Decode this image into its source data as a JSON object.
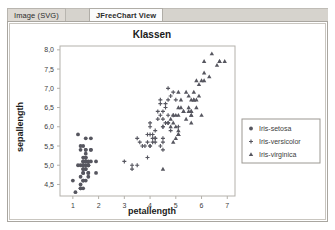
{
  "window": {
    "tabs": [
      {
        "label": "Image (SVG)",
        "active": false
      },
      {
        "label": "JFreeChart View",
        "active": true
      }
    ]
  },
  "chart_data": {
    "type": "scatter",
    "title": "Klassen",
    "xlabel": "petallength",
    "ylabel": "sepallength",
    "xlim": [
      0.5,
      7.3
    ],
    "ylim": [
      4.2,
      8.1
    ],
    "xticks": [
      "1",
      "2",
      "3",
      "4",
      "5",
      "6",
      "7"
    ],
    "xtick_values": [
      1,
      2,
      3,
      4,
      5,
      6,
      7
    ],
    "yticks": [
      "4,5",
      "5,0",
      "5,5",
      "6,0",
      "6,5",
      "7,0",
      "7,5",
      "8,0"
    ],
    "ytick_values": [
      4.5,
      5.0,
      5.5,
      6.0,
      6.5,
      7.0,
      7.5,
      8.0
    ],
    "grid": false,
    "legend_position": "right",
    "colors": {
      "point": "#5a5a66",
      "frame": "#b4b1ab",
      "text": "#1a1a1a"
    },
    "series": [
      {
        "name": "Iris-setosa",
        "marker": "circle",
        "color": "#56565f",
        "points": [
          [
            1.4,
            5.1
          ],
          [
            1.4,
            4.9
          ],
          [
            1.3,
            4.7
          ],
          [
            1.5,
            4.6
          ],
          [
            1.4,
            5.0
          ],
          [
            1.7,
            5.4
          ],
          [
            1.4,
            4.6
          ],
          [
            1.5,
            5.0
          ],
          [
            1.4,
            4.4
          ],
          [
            1.5,
            4.9
          ],
          [
            1.5,
            5.4
          ],
          [
            1.6,
            4.8
          ],
          [
            1.4,
            4.8
          ],
          [
            1.1,
            4.3
          ],
          [
            1.2,
            5.8
          ],
          [
            1.5,
            5.7
          ],
          [
            1.3,
            5.4
          ],
          [
            1.4,
            5.1
          ],
          [
            1.7,
            5.7
          ],
          [
            1.5,
            5.1
          ],
          [
            1.7,
            5.4
          ],
          [
            1.5,
            5.1
          ],
          [
            1.0,
            4.6
          ],
          [
            1.7,
            5.1
          ],
          [
            1.9,
            4.8
          ],
          [
            1.6,
            5.0
          ],
          [
            1.6,
            5.0
          ],
          [
            1.5,
            5.2
          ],
          [
            1.4,
            5.2
          ],
          [
            1.6,
            4.7
          ],
          [
            1.6,
            4.8
          ],
          [
            1.5,
            5.4
          ],
          [
            1.5,
            5.2
          ],
          [
            1.4,
            5.5
          ],
          [
            1.5,
            4.9
          ],
          [
            1.2,
            5.0
          ],
          [
            1.3,
            5.5
          ],
          [
            1.4,
            4.9
          ],
          [
            1.3,
            4.4
          ],
          [
            1.5,
            5.1
          ],
          [
            1.3,
            5.0
          ],
          [
            1.3,
            4.5
          ],
          [
            1.3,
            4.4
          ],
          [
            1.6,
            5.0
          ],
          [
            1.9,
            5.1
          ],
          [
            1.4,
            4.8
          ],
          [
            1.6,
            5.1
          ],
          [
            1.4,
            4.6
          ],
          [
            1.5,
            5.3
          ],
          [
            1.4,
            5.0
          ]
        ]
      },
      {
        "name": "Iris-versicolor",
        "marker": "plus",
        "color": "#56565f",
        "points": [
          [
            4.7,
            7.0
          ],
          [
            4.5,
            6.4
          ],
          [
            4.9,
            6.9
          ],
          [
            4.0,
            5.5
          ],
          [
            4.6,
            6.5
          ],
          [
            4.5,
            5.7
          ],
          [
            4.7,
            6.3
          ],
          [
            3.3,
            4.9
          ],
          [
            4.6,
            6.6
          ],
          [
            3.9,
            5.2
          ],
          [
            3.5,
            5.0
          ],
          [
            4.2,
            5.9
          ],
          [
            4.0,
            6.0
          ],
          [
            4.7,
            6.1
          ],
          [
            3.6,
            5.6
          ],
          [
            4.4,
            6.7
          ],
          [
            4.5,
            5.6
          ],
          [
            4.1,
            5.8
          ],
          [
            4.5,
            6.2
          ],
          [
            3.9,
            5.6
          ],
          [
            4.8,
            5.9
          ],
          [
            4.0,
            6.1
          ],
          [
            4.9,
            6.3
          ],
          [
            4.7,
            6.1
          ],
          [
            4.3,
            6.4
          ],
          [
            4.4,
            6.6
          ],
          [
            4.8,
            6.8
          ],
          [
            5.0,
            6.7
          ],
          [
            4.5,
            6.0
          ],
          [
            3.5,
            5.7
          ],
          [
            3.8,
            5.5
          ],
          [
            3.7,
            5.5
          ],
          [
            3.9,
            5.8
          ],
          [
            5.1,
            6.0
          ],
          [
            4.5,
            5.4
          ],
          [
            4.5,
            6.0
          ],
          [
            4.7,
            6.7
          ],
          [
            4.4,
            6.3
          ],
          [
            4.1,
            5.6
          ],
          [
            4.0,
            5.5
          ],
          [
            4.4,
            5.5
          ],
          [
            4.6,
            6.1
          ],
          [
            4.0,
            5.8
          ],
          [
            3.3,
            5.0
          ],
          [
            4.2,
            5.6
          ],
          [
            4.2,
            5.7
          ],
          [
            4.2,
            5.7
          ],
          [
            4.3,
            6.2
          ],
          [
            3.0,
            5.1
          ],
          [
            4.1,
            5.7
          ]
        ]
      },
      {
        "name": "Iris-virginica",
        "marker": "triangle",
        "color": "#56565f",
        "points": [
          [
            6.0,
            6.3
          ],
          [
            5.1,
            5.8
          ],
          [
            5.9,
            7.1
          ],
          [
            5.6,
            6.3
          ],
          [
            5.8,
            6.5
          ],
          [
            6.6,
            7.6
          ],
          [
            4.5,
            4.9
          ],
          [
            6.3,
            7.3
          ],
          [
            5.8,
            6.7
          ],
          [
            6.1,
            7.2
          ],
          [
            5.1,
            6.5
          ],
          [
            5.3,
            6.4
          ],
          [
            5.5,
            6.8
          ],
          [
            5.0,
            5.7
          ],
          [
            5.1,
            5.8
          ],
          [
            5.3,
            6.4
          ],
          [
            5.5,
            6.5
          ],
          [
            6.7,
            7.7
          ],
          [
            6.9,
            7.7
          ],
          [
            5.0,
            6.0
          ],
          [
            5.7,
            6.9
          ],
          [
            4.9,
            5.6
          ],
          [
            6.7,
            7.7
          ],
          [
            4.9,
            6.3
          ],
          [
            5.7,
            6.7
          ],
          [
            6.0,
            7.2
          ],
          [
            4.8,
            6.2
          ],
          [
            4.9,
            6.1
          ],
          [
            5.6,
            6.4
          ],
          [
            5.8,
            7.2
          ],
          [
            6.1,
            7.4
          ],
          [
            6.4,
            7.9
          ],
          [
            5.6,
            6.4
          ],
          [
            5.1,
            6.3
          ],
          [
            5.6,
            6.1
          ],
          [
            6.1,
            7.7
          ],
          [
            5.6,
            6.3
          ],
          [
            5.5,
            6.4
          ],
          [
            4.8,
            6.0
          ],
          [
            5.4,
            6.9
          ],
          [
            5.6,
            6.7
          ],
          [
            5.1,
            6.9
          ],
          [
            5.1,
            5.8
          ],
          [
            5.9,
            6.8
          ],
          [
            5.7,
            6.7
          ],
          [
            5.2,
            6.7
          ],
          [
            5.0,
            6.3
          ],
          [
            5.2,
            6.5
          ],
          [
            5.4,
            6.2
          ],
          [
            5.1,
            5.9
          ]
        ]
      }
    ]
  }
}
